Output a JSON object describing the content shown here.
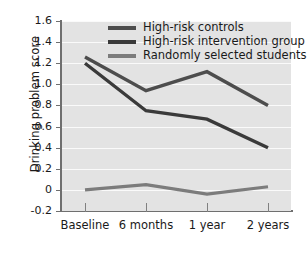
{
  "chart_data": {
    "type": "line",
    "title": "",
    "xlabel": "",
    "ylabel": "Drinking problem score",
    "categories": [
      "Baseline",
      "6 months",
      "1 year",
      "2 years"
    ],
    "ylim": [
      -0.2,
      1.6
    ],
    "yticks": [
      "1.6",
      "1.4",
      "1.2",
      "1.0",
      "0.8",
      "0.6",
      "0.4",
      "0.2",
      "0",
      "-0.2"
    ],
    "ytick_values": [
      1.6,
      1.4,
      1.2,
      1.0,
      0.8,
      0.6,
      0.4,
      0.2,
      0.0,
      -0.2
    ],
    "grid": true,
    "legend_position": "top-right-inside",
    "series": [
      {
        "name": "High-risk controls",
        "values": [
          1.26,
          0.94,
          1.12,
          0.8
        ],
        "color": "#4d4d4d"
      },
      {
        "name": "High-risk intervention group",
        "values": [
          1.2,
          0.75,
          0.67,
          0.4
        ],
        "color": "#3a3a3a"
      },
      {
        "name": "Randomly selected students",
        "values": [
          0.0,
          0.05,
          -0.04,
          0.03
        ],
        "color": "#7c7c7c"
      }
    ]
  },
  "style": {
    "plot_background": "#e3e3e3",
    "gridline_color": "#fafafa",
    "axis_color": "#6f6f6f",
    "text_color": "#1a1a1a"
  }
}
